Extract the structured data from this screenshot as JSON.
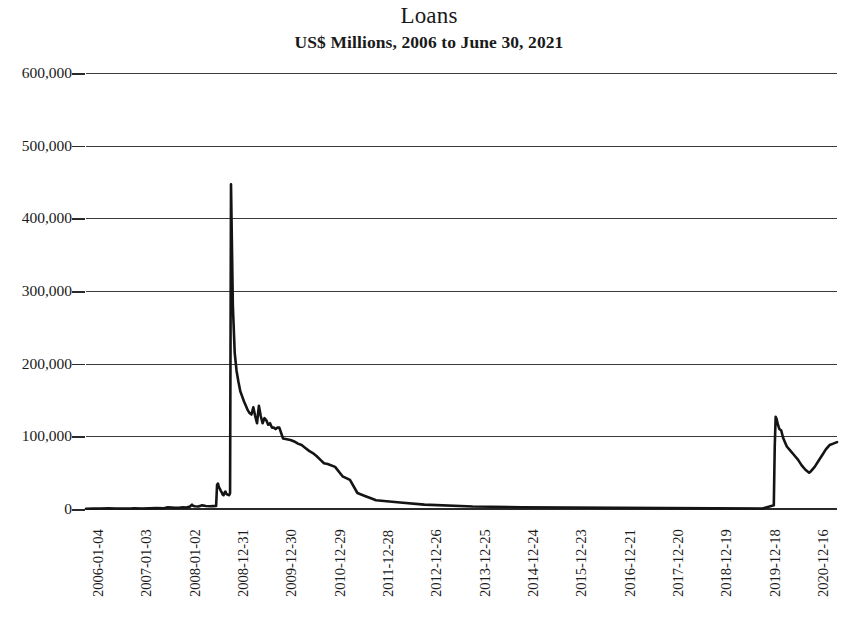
{
  "chart_data": {
    "type": "line",
    "title": "Loans",
    "subtitle": "US$ Millions, 2006 to June 30, 2021",
    "xlabel": "",
    "ylabel": "",
    "ylim": [
      0,
      600000
    ],
    "y_ticks": [
      0,
      100000,
      200000,
      300000,
      400000,
      500000,
      600000
    ],
    "y_tick_labels": [
      "0",
      "100,000",
      "200,000",
      "300,000",
      "400,000",
      "500,000",
      "600,000"
    ],
    "grid": true,
    "legend": "none",
    "x_tick_labels": [
      "2006-01-04",
      "2007-01-03",
      "2008-01-02",
      "2008-12-31",
      "2009-12-30",
      "2010-12-29",
      "2011-12-28",
      "2012-12-26",
      "2013-12-25",
      "2014-12-24",
      "2015-12-23",
      "2016-12-21",
      "2017-12-20",
      "2018-12-19",
      "2019-12-18",
      "2020-12-16"
    ],
    "x_domain": [
      "2006-01-04",
      "2021-06-30"
    ],
    "series": [
      {
        "name": "Loans",
        "x": [
          "2006-01-04",
          "2006-03-01",
          "2006-04-26",
          "2006-06-21",
          "2006-08-16",
          "2006-10-11",
          "2006-12-06",
          "2007-01-03",
          "2007-02-28",
          "2007-04-25",
          "2007-06-20",
          "2007-08-15",
          "2007-09-12",
          "2007-10-10",
          "2007-11-07",
          "2007-12-05",
          "2008-01-02",
          "2008-01-30",
          "2008-02-27",
          "2008-03-12",
          "2008-03-19",
          "2008-04-02",
          "2008-04-30",
          "2008-05-28",
          "2008-06-25",
          "2008-07-23",
          "2008-08-20",
          "2008-09-10",
          "2008-09-17",
          "2008-09-24",
          "2008-10-01",
          "2008-10-08",
          "2008-10-15",
          "2008-10-22",
          "2008-10-29",
          "2008-11-05",
          "2008-11-12",
          "2008-11-19",
          "2008-11-26",
          "2008-12-03",
          "2008-12-10",
          "2008-12-17",
          "2008-12-24",
          "2008-12-31",
          "2009-01-14",
          "2009-01-28",
          "2009-02-11",
          "2009-02-25",
          "2009-03-11",
          "2009-03-25",
          "2009-04-08",
          "2009-04-22",
          "2009-05-06",
          "2009-05-20",
          "2009-06-03",
          "2009-06-17",
          "2009-07-01",
          "2009-07-15",
          "2009-07-29",
          "2009-08-12",
          "2009-08-26",
          "2009-09-09",
          "2009-09-23",
          "2009-10-07",
          "2009-10-21",
          "2009-11-04",
          "2009-11-18",
          "2009-12-02",
          "2009-12-16",
          "2009-12-30",
          "2010-01-27",
          "2010-02-24",
          "2010-03-24",
          "2010-04-21",
          "2010-05-19",
          "2010-06-16",
          "2010-07-14",
          "2010-08-11",
          "2010-09-08",
          "2010-10-06",
          "2010-11-03",
          "2010-12-01",
          "2010-12-29",
          "2011-02-23",
          "2011-04-20",
          "2011-06-15",
          "2011-08-10",
          "2011-10-05",
          "2011-11-30",
          "2011-12-28",
          "2012-06-27",
          "2012-12-26",
          "2013-12-25",
          "2014-12-24",
          "2015-12-23",
          "2016-12-21",
          "2017-12-20",
          "2018-12-19",
          "2019-12-18",
          "2020-03-11",
          "2020-03-18",
          "2020-03-25",
          "2020-04-01",
          "2020-04-08",
          "2020-04-15",
          "2020-04-22",
          "2020-05-06",
          "2020-05-20",
          "2020-06-03",
          "2020-06-17",
          "2020-07-15",
          "2020-08-12",
          "2020-09-09",
          "2020-10-07",
          "2020-11-04",
          "2020-12-02",
          "2020-12-16",
          "2021-01-13",
          "2021-02-10",
          "2021-03-10",
          "2021-04-07",
          "2021-05-05",
          "2021-06-02",
          "2021-06-30"
        ],
        "y": [
          400,
          500,
          600,
          900,
          700,
          500,
          600,
          800,
          700,
          900,
          1200,
          1000,
          2500,
          2000,
          1500,
          1800,
          2200,
          2000,
          3500,
          6000,
          4500,
          3800,
          3500,
          5000,
          4200,
          3800,
          4000,
          4200,
          33000,
          35000,
          30000,
          28000,
          25000,
          23000,
          20000,
          19000,
          22000,
          24000,
          21000,
          20000,
          19500,
          19000,
          22000,
          447000,
          280000,
          215000,
          190000,
          175000,
          162000,
          155000,
          148000,
          142000,
          136000,
          132000,
          130000,
          140000,
          128000,
          118000,
          142000,
          128000,
          118000,
          125000,
          122000,
          116000,
          118000,
          112000,
          112000,
          110000,
          112000,
          112000,
          97000,
          96000,
          95000,
          93000,
          90000,
          88000,
          84000,
          80000,
          77000,
          73000,
          68000,
          63000,
          62000,
          58000,
          45000,
          40000,
          22000,
          18000,
          14000,
          12000,
          9000,
          6000,
          3500,
          2500,
          2000,
          1600,
          1200,
          900,
          700,
          5000,
          85000,
          127000,
          124000,
          118000,
          114000,
          110000,
          108000,
          98000,
          92000,
          86000,
          80000,
          74000,
          68000,
          60000,
          54000,
          50000,
          52000,
          58000,
          66000,
          74000,
          82000,
          88000,
          90000,
          92000
        ]
      }
    ]
  }
}
